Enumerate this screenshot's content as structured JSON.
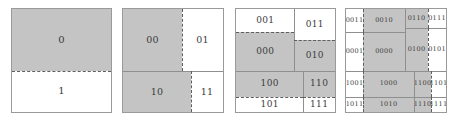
{
  "figure": {
    "title": "",
    "background_color": "#ffffff",
    "panel_border_color": "#9a9a9a",
    "shade_color": "#c4c4c4",
    "label_color": "#3b3b3b",
    "solid_divider_color": "#8f8f8f",
    "dashed_divider_color": "#5f5f5f"
  },
  "chart_data": {
    "type": "table",
    "title": "",
    "subtitle": "",
    "xlabel": "",
    "ylabel": "",
    "panels": [
      {
        "index": 1,
        "depth": 1,
        "cell_count": 2,
        "cells": [
          {
            "label": "0",
            "shaded": true,
            "x": 0,
            "y": 0,
            "w": 100,
            "h": 60
          },
          {
            "label": "1",
            "shaded": false,
            "x": 0,
            "y": 60,
            "w": 100,
            "h": 40
          }
        ],
        "dividers": [
          {
            "orient": "h",
            "style": "dashed",
            "pos": 60,
            "from": 0,
            "to": 100
          }
        ]
      },
      {
        "index": 2,
        "depth": 2,
        "cell_count": 4,
        "cells": [
          {
            "label": "00",
            "shaded": true,
            "x": 0,
            "y": 0,
            "w": 59,
            "h": 60
          },
          {
            "label": "01",
            "shaded": false,
            "x": 59,
            "y": 0,
            "w": 41,
            "h": 60
          },
          {
            "label": "10",
            "shaded": true,
            "x": 0,
            "y": 60,
            "w": 68,
            "h": 40
          },
          {
            "label": "11",
            "shaded": false,
            "x": 68,
            "y": 60,
            "w": 32,
            "h": 40
          }
        ],
        "dividers": [
          {
            "orient": "h",
            "style": "solid",
            "pos": 60,
            "from": 0,
            "to": 100
          },
          {
            "orient": "v",
            "style": "dashed",
            "pos": 59,
            "from": 0,
            "to": 60
          },
          {
            "orient": "v",
            "style": "dashed",
            "pos": 68,
            "from": 60,
            "to": 100
          }
        ]
      },
      {
        "index": 3,
        "depth": 3,
        "cell_count": 8,
        "cells": [
          {
            "label": "001",
            "shaded": false,
            "x": 0,
            "y": 0,
            "w": 59,
            "h": 22
          },
          {
            "label": "011",
            "shaded": false,
            "x": 59,
            "y": 0,
            "w": 41,
            "h": 30
          },
          {
            "label": "000",
            "shaded": true,
            "x": 0,
            "y": 22,
            "w": 59,
            "h": 38
          },
          {
            "label": "010",
            "shaded": true,
            "x": 59,
            "y": 30,
            "w": 41,
            "h": 30
          },
          {
            "label": "100",
            "shaded": true,
            "x": 0,
            "y": 60,
            "w": 68,
            "h": 25
          },
          {
            "label": "110",
            "shaded": true,
            "x": 68,
            "y": 60,
            "w": 32,
            "h": 25
          },
          {
            "label": "101",
            "shaded": false,
            "x": 0,
            "y": 85,
            "w": 68,
            "h": 15
          },
          {
            "label": "111",
            "shaded": false,
            "x": 68,
            "y": 85,
            "w": 32,
            "h": 15
          }
        ],
        "dividers": [
          {
            "orient": "h",
            "style": "solid",
            "pos": 60,
            "from": 0,
            "to": 100
          },
          {
            "orient": "v",
            "style": "solid",
            "pos": 59,
            "from": 0,
            "to": 60
          },
          {
            "orient": "v",
            "style": "solid",
            "pos": 68,
            "from": 60,
            "to": 100
          },
          {
            "orient": "h",
            "style": "dashed",
            "pos": 22,
            "from": 0,
            "to": 59
          },
          {
            "orient": "h",
            "style": "dashed",
            "pos": 30,
            "from": 59,
            "to": 100
          },
          {
            "orient": "h",
            "style": "dashed",
            "pos": 85,
            "from": 0,
            "to": 68
          },
          {
            "orient": "h",
            "style": "dashed",
            "pos": 85,
            "from": 68,
            "to": 100
          }
        ]
      },
      {
        "index": 4,
        "depth": 4,
        "cell_count": 16,
        "cells": [
          {
            "label": "0011",
            "shaded": false,
            "x": 0,
            "y": 0,
            "w": 17,
            "h": 22
          },
          {
            "label": "0010",
            "shaded": true,
            "x": 17,
            "y": 0,
            "w": 42,
            "h": 22
          },
          {
            "label": "0110",
            "shaded": true,
            "x": 59,
            "y": 0,
            "w": 23,
            "h": 18
          },
          {
            "label": "0111",
            "shaded": false,
            "x": 82,
            "y": 0,
            "w": 18,
            "h": 18
          },
          {
            "label": "0001",
            "shaded": false,
            "x": 0,
            "y": 22,
            "w": 17,
            "h": 38
          },
          {
            "label": "0000",
            "shaded": true,
            "x": 17,
            "y": 22,
            "w": 42,
            "h": 38
          },
          {
            "label": "0100",
            "shaded": true,
            "x": 59,
            "y": 18,
            "w": 23,
            "h": 42
          },
          {
            "label": "0101",
            "shaded": false,
            "x": 82,
            "y": 18,
            "w": 18,
            "h": 42
          },
          {
            "label": "1001",
            "shaded": false,
            "x": 0,
            "y": 60,
            "w": 17,
            "h": 25
          },
          {
            "label": "1000",
            "shaded": true,
            "x": 17,
            "y": 60,
            "w": 51,
            "h": 25
          },
          {
            "label": "1100",
            "shaded": true,
            "x": 68,
            "y": 60,
            "w": 17,
            "h": 25
          },
          {
            "label": "1101",
            "shaded": false,
            "x": 85,
            "y": 60,
            "w": 15,
            "h": 25
          },
          {
            "label": "1011",
            "shaded": false,
            "x": 0,
            "y": 85,
            "w": 17,
            "h": 15
          },
          {
            "label": "1010",
            "shaded": true,
            "x": 17,
            "y": 85,
            "w": 51,
            "h": 15
          },
          {
            "label": "1110",
            "shaded": true,
            "x": 68,
            "y": 85,
            "w": 17,
            "h": 15
          },
          {
            "label": "1111",
            "shaded": false,
            "x": 85,
            "y": 85,
            "w": 15,
            "h": 15
          }
        ],
        "dividers": [
          {
            "orient": "h",
            "style": "solid",
            "pos": 60,
            "from": 0,
            "to": 100
          },
          {
            "orient": "v",
            "style": "solid",
            "pos": 59,
            "from": 0,
            "to": 60
          },
          {
            "orient": "v",
            "style": "solid",
            "pos": 68,
            "from": 60,
            "to": 100
          },
          {
            "orient": "h",
            "style": "solid",
            "pos": 22,
            "from": 0,
            "to": 59
          },
          {
            "orient": "h",
            "style": "solid",
            "pos": 18,
            "from": 59,
            "to": 100
          },
          {
            "orient": "h",
            "style": "solid",
            "pos": 85,
            "from": 0,
            "to": 68
          },
          {
            "orient": "h",
            "style": "solid",
            "pos": 85,
            "from": 68,
            "to": 100
          },
          {
            "orient": "v",
            "style": "dashed",
            "pos": 17,
            "from": 0,
            "to": 22
          },
          {
            "orient": "v",
            "style": "dashed",
            "pos": 17,
            "from": 22,
            "to": 60
          },
          {
            "orient": "v",
            "style": "dashed",
            "pos": 82,
            "from": 0,
            "to": 18
          },
          {
            "orient": "v",
            "style": "dashed",
            "pos": 82,
            "from": 18,
            "to": 60
          },
          {
            "orient": "v",
            "style": "dashed",
            "pos": 17,
            "from": 60,
            "to": 85
          },
          {
            "orient": "v",
            "style": "dashed",
            "pos": 17,
            "from": 85,
            "to": 100
          },
          {
            "orient": "v",
            "style": "dashed",
            "pos": 85,
            "from": 60,
            "to": 85
          },
          {
            "orient": "v",
            "style": "dashed",
            "pos": 85,
            "from": 85,
            "to": 100
          }
        ]
      }
    ]
  }
}
